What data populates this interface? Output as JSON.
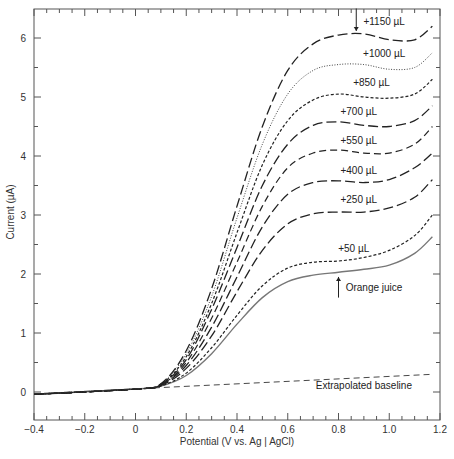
{
  "chart_data": {
    "type": "line",
    "title": "",
    "xlabel": "Potential (V vs. Ag | AgCl)",
    "ylabel": "Current (µA)",
    "xlim": [
      -0.4,
      1.2
    ],
    "ylim": [
      -0.47,
      6.5
    ],
    "xticks": [
      -0.4,
      -0.2,
      0,
      0.2,
      0.4,
      0.6,
      0.8,
      1.0,
      1.2
    ],
    "xtick_labels": [
      "-0.4",
      "-0.2",
      "0",
      "0.2",
      "0.4",
      "0.6",
      "0.8",
      "1.0",
      "1.2"
    ],
    "yticks": [
      0,
      1,
      2,
      3,
      4,
      5,
      6
    ],
    "ytick_labels": [
      "0",
      "1",
      "2",
      "3",
      "4",
      "5",
      "6"
    ],
    "grid": false,
    "legend": "inline annotations",
    "series": [
      {
        "name": "Orange juice",
        "style": "solid-gray",
        "x": [
          -0.4,
          0.0,
          0.1,
          0.2,
          0.3,
          0.4,
          0.5,
          0.6,
          0.7,
          0.8,
          0.9,
          1.0,
          1.1,
          1.17
        ],
        "y": [
          -0.04,
          0.05,
          0.1,
          0.28,
          0.65,
          1.15,
          1.6,
          1.87,
          1.98,
          2.03,
          2.08,
          2.15,
          2.35,
          2.63
        ]
      },
      {
        "name": "+50 µL",
        "style": "short-dash",
        "x": [
          -0.4,
          0.0,
          0.1,
          0.2,
          0.3,
          0.4,
          0.5,
          0.6,
          0.7,
          0.8,
          0.9,
          1.0,
          1.1,
          1.17
        ],
        "y": [
          -0.04,
          0.05,
          0.1,
          0.32,
          0.75,
          1.3,
          1.8,
          2.1,
          2.2,
          2.22,
          2.28,
          2.4,
          2.65,
          3.0
        ]
      },
      {
        "name": "+250 µL",
        "style": "long-dash",
        "x": [
          -0.4,
          0.0,
          0.1,
          0.2,
          0.3,
          0.4,
          0.5,
          0.6,
          0.7,
          0.8,
          0.9,
          1.0,
          1.1,
          1.17
        ],
        "y": [
          -0.04,
          0.05,
          0.11,
          0.4,
          0.95,
          1.7,
          2.4,
          2.85,
          3.02,
          3.05,
          3.05,
          3.12,
          3.3,
          3.6
        ]
      },
      {
        "name": "+400 µL",
        "style": "long-dash",
        "x": [
          -0.4,
          0.0,
          0.1,
          0.2,
          0.3,
          0.4,
          0.5,
          0.6,
          0.7,
          0.8,
          0.9,
          1.0,
          1.1,
          1.17
        ],
        "y": [
          -0.04,
          0.05,
          0.12,
          0.45,
          1.1,
          1.95,
          2.8,
          3.35,
          3.55,
          3.58,
          3.55,
          3.6,
          3.8,
          4.05
        ]
      },
      {
        "name": "+550 µL",
        "style": "medium-dash",
        "x": [
          -0.4,
          0.0,
          0.1,
          0.2,
          0.3,
          0.4,
          0.5,
          0.6,
          0.7,
          0.8,
          0.9,
          1.0,
          1.1,
          1.17
        ],
        "y": [
          -0.04,
          0.05,
          0.12,
          0.5,
          1.25,
          2.2,
          3.15,
          3.8,
          4.05,
          4.1,
          4.05,
          4.05,
          4.2,
          4.5
        ]
      },
      {
        "name": "+700 µL",
        "style": "long-dash",
        "x": [
          -0.4,
          0.0,
          0.1,
          0.2,
          0.3,
          0.4,
          0.5,
          0.6,
          0.7,
          0.8,
          0.9,
          1.0,
          1.1,
          1.17
        ],
        "y": [
          -0.04,
          0.05,
          0.13,
          0.55,
          1.4,
          2.45,
          3.5,
          4.2,
          4.52,
          4.58,
          4.52,
          4.5,
          4.6,
          4.85
        ]
      },
      {
        "name": "+850 µL",
        "style": "short-dash",
        "x": [
          -0.4,
          0.0,
          0.1,
          0.2,
          0.3,
          0.4,
          0.5,
          0.6,
          0.7,
          0.8,
          0.9,
          1.0,
          1.1,
          1.17
        ],
        "y": [
          -0.04,
          0.05,
          0.13,
          0.6,
          1.5,
          2.7,
          3.85,
          4.6,
          4.95,
          5.05,
          5.0,
          4.98,
          5.05,
          5.3
        ]
      },
      {
        "name": "+1000 µL",
        "style": "dotted",
        "x": [
          -0.4,
          0.0,
          0.1,
          0.2,
          0.3,
          0.4,
          0.5,
          0.6,
          0.7,
          0.8,
          0.9,
          1.0,
          1.1,
          1.17
        ],
        "y": [
          -0.04,
          0.05,
          0.14,
          0.65,
          1.62,
          2.95,
          4.2,
          5.05,
          5.45,
          5.55,
          5.55,
          5.47,
          5.5,
          5.75
        ]
      },
      {
        "name": "+1150 µL",
        "style": "long-dash",
        "x": [
          -0.4,
          0.0,
          0.1,
          0.2,
          0.3,
          0.4,
          0.5,
          0.6,
          0.7,
          0.8,
          0.9,
          1.0,
          1.1,
          1.17
        ],
        "y": [
          -0.04,
          0.05,
          0.14,
          0.7,
          1.75,
          3.15,
          4.5,
          5.45,
          5.9,
          6.05,
          6.07,
          5.97,
          5.97,
          6.2
        ]
      },
      {
        "name": "Extrapolated baseline",
        "style": "dashed",
        "x": [
          -0.4,
          1.17
        ],
        "y": [
          -0.03,
          0.3
        ]
      }
    ],
    "annotations": [
      {
        "text": "+1150 µL",
        "x": 0.98,
        "y": 6.22
      },
      {
        "text": "+1000 µL",
        "x": 0.98,
        "y": 5.68
      },
      {
        "text": "+850 µL",
        "x": 0.93,
        "y": 5.18
      },
      {
        "text": "+700 µL",
        "x": 0.88,
        "y": 4.7
      },
      {
        "text": "+550 µL",
        "x": 0.88,
        "y": 4.2
      },
      {
        "text": "+400 µL",
        "x": 0.88,
        "y": 3.7
      },
      {
        "text": "+250 µL",
        "x": 0.88,
        "y": 3.2
      },
      {
        "text": "+50 µL",
        "x": 0.86,
        "y": 2.38
      },
      {
        "text": "Orange juice",
        "x": 0.94,
        "y": 1.72
      },
      {
        "text": "Extrapolated baseline",
        "x": 0.9,
        "y": 0.05
      }
    ],
    "arrows": [
      {
        "label": "+1150 µL",
        "x": 0.87,
        "y_from": 6.5,
        "y_to": 6.12,
        "direction": "down"
      },
      {
        "label": "Orange juice",
        "x": 0.8,
        "y_from": 1.6,
        "y_to": 1.95,
        "direction": "up"
      }
    ]
  }
}
